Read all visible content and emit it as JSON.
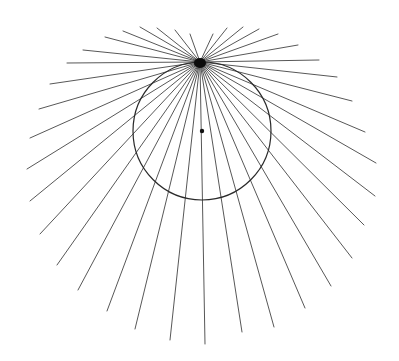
{
  "diagram": {
    "colors": {
      "background": "#ffffff",
      "ray": "#3a3a3a",
      "circle": "#2a2a2a",
      "dot": "#111111"
    },
    "focal_point": {
      "x": 200,
      "y": 62
    },
    "circle": {
      "cx": 202,
      "cy": 131,
      "r": 69
    },
    "center_dot": {
      "x": 202,
      "y": 131,
      "r": 2.2
    },
    "rays": [
      {
        "x": 190,
        "y": 34
      },
      {
        "x": 175,
        "y": 30
      },
      {
        "x": 157,
        "y": 28
      },
      {
        "x": 140,
        "y": 27
      },
      {
        "x": 123,
        "y": 31
      },
      {
        "x": 105,
        "y": 37
      },
      {
        "x": 83,
        "y": 50
      },
      {
        "x": 67,
        "y": 63
      },
      {
        "x": 50,
        "y": 84
      },
      {
        "x": 39,
        "y": 109
      },
      {
        "x": 30,
        "y": 138
      },
      {
        "x": 27,
        "y": 169
      },
      {
        "x": 30,
        "y": 201
      },
      {
        "x": 40,
        "y": 234
      },
      {
        "x": 57,
        "y": 265
      },
      {
        "x": 78,
        "y": 290
      },
      {
        "x": 107,
        "y": 311
      },
      {
        "x": 135,
        "y": 329
      },
      {
        "x": 170,
        "y": 340
      },
      {
        "x": 205,
        "y": 344
      },
      {
        "x": 242,
        "y": 332
      },
      {
        "x": 274,
        "y": 327
      },
      {
        "x": 305,
        "y": 308
      },
      {
        "x": 331,
        "y": 286
      },
      {
        "x": 352,
        "y": 258
      },
      {
        "x": 364,
        "y": 225
      },
      {
        "x": 375,
        "y": 196
      },
      {
        "x": 376,
        "y": 163
      },
      {
        "x": 365,
        "y": 132
      },
      {
        "x": 352,
        "y": 101
      },
      {
        "x": 337,
        "y": 77
      },
      {
        "x": 319,
        "y": 60
      },
      {
        "x": 298,
        "y": 45
      },
      {
        "x": 278,
        "y": 34
      },
      {
        "x": 259,
        "y": 29
      },
      {
        "x": 243,
        "y": 27
      },
      {
        "x": 227,
        "y": 28
      },
      {
        "x": 213,
        "y": 34
      }
    ]
  }
}
